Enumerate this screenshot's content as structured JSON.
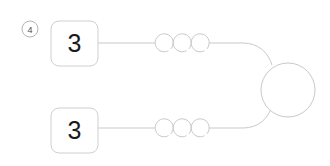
{
  "diagram": {
    "title": "",
    "step_badge": {
      "label": "4",
      "shape": "circle"
    },
    "colors": {
      "stroke": "#c9c9c9",
      "node_border": "#cfcfcf",
      "node_fill": "#ffffff",
      "text": "#1a1a1a",
      "badge_text": "#4a4a4a",
      "background": "#ffffff"
    },
    "nodes": [
      {
        "id": "node-top",
        "label": "3",
        "shape": "rounded-square",
        "x": 51,
        "y": 21,
        "w": 47,
        "h": 45
      },
      {
        "id": "node-bottom",
        "label": "3",
        "shape": "rounded-square",
        "x": 51,
        "y": 108,
        "w": 47,
        "h": 45
      },
      {
        "id": "node-junction",
        "label": "",
        "shape": "circle",
        "cx": 288,
        "cy": 90,
        "r": 27
      }
    ],
    "edges": [
      {
        "id": "edge-top",
        "from": "node-top",
        "to": "node-junction",
        "loop_count": 3,
        "loop_label": "",
        "y": 43
      },
      {
        "id": "edge-bottom",
        "from": "node-bottom",
        "to": "node-junction",
        "loop_count": 3,
        "loop_label": "",
        "y": 128
      }
    ],
    "loops": {
      "radius": 9,
      "top_centers_x": [
        164,
        182,
        200
      ],
      "bottom_centers_x": [
        164,
        182,
        200
      ],
      "gap_degrees": 50
    }
  }
}
